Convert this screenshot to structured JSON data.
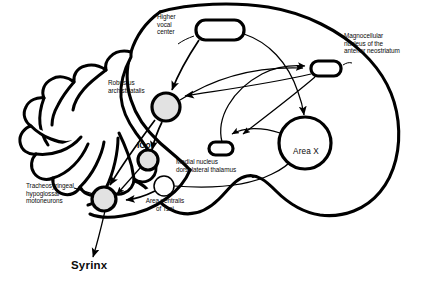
{
  "figure": {
    "kind": "anatomical-circuit-diagram",
    "background_color": "#ffffff",
    "stroke_color": "#000000",
    "nucleus_fill_shaded": "#e2e2e2",
    "nucleus_fill_plain": "#ffffff"
  },
  "labels": {
    "higher_vocal_center": "Higher\nvocal\ncenter",
    "magnocellular_nucleus": "Magnocellular\nnucleus of the\nanterior neostriatum",
    "robustus_archistriatalis": "Robustus\narchistriatalis",
    "medial_nucleus_dlm": "Medial nucleus\ndorsolateral thalamus",
    "area_x": "Area X",
    "ico": "ICo",
    "tracheosyringeal": "Tracheosyringeal\nhypoglossal\nmotoneurons",
    "area_ventralis_tsai": "Area ventralis\nof Tsai",
    "syrinx": "Syrinx"
  },
  "nodes": [
    {
      "id": "hvc",
      "label": "Higher vocal center",
      "shape": "rounded-rect",
      "fill": "#ffffff",
      "x": 196,
      "y": 20,
      "w": 48,
      "h": 20
    },
    {
      "id": "man",
      "label": "Magnocellular nucleus of the anterior neostriatum",
      "shape": "rounded-rect",
      "fill": "#ffffff",
      "x": 311,
      "y": 62,
      "w": 30,
      "h": 14
    },
    {
      "id": "ra",
      "label": "Robustus archistriatalis",
      "shape": "circle",
      "fill": "#e2e2e2",
      "cx": 166,
      "cy": 108,
      "r": 14
    },
    {
      "id": "dlm",
      "label": "Medial nucleus dorsolateral thalamus",
      "shape": "rounded-rect",
      "fill": "#ffffff",
      "x": 209,
      "y": 143,
      "w": 24,
      "h": 12
    },
    {
      "id": "areax",
      "label": "Area X",
      "shape": "circle",
      "fill": "#ffffff",
      "cx": 305,
      "cy": 143,
      "r": 26
    },
    {
      "id": "ico",
      "label": "ICo",
      "shape": "circle",
      "fill": "#e2e2e2",
      "cx": 148,
      "cy": 160,
      "r": 10
    },
    {
      "id": "nxiits",
      "label": "Tracheosyringeal hypoglossal motoneurons",
      "shape": "circle",
      "fill": "#e2e2e2",
      "cx": 104,
      "cy": 199,
      "r": 12
    },
    {
      "id": "avt",
      "label": "Area ventralis of Tsai",
      "shape": "circle",
      "fill": "#ffffff",
      "cx": 164,
      "cy": 186,
      "r": 10
    }
  ],
  "connections": [
    {
      "from": "hvc",
      "to": "ra",
      "arrow": true
    },
    {
      "from": "hvc",
      "to": "areax",
      "arrow": true
    },
    {
      "from": "ra",
      "to": "man",
      "arrow": true
    },
    {
      "from": "man",
      "to": "ra",
      "arrow": true
    },
    {
      "from": "man",
      "to": "dlm",
      "arrow": true
    },
    {
      "from": "dlm",
      "to": "man",
      "arrow": true
    },
    {
      "from": "areax",
      "to": "dlm",
      "arrow": true
    },
    {
      "from": "avt",
      "to": "areax",
      "arrow": true
    },
    {
      "from": "ra",
      "to": "ico",
      "arrow": true
    },
    {
      "from": "ra",
      "to": "nxiits",
      "arrow": true
    },
    {
      "from": "ico",
      "to": "nxiits",
      "arrow": true
    },
    {
      "from": "avt",
      "to": "nxiits",
      "arrow": true
    },
    {
      "from": "nxiits",
      "to": "syrinx",
      "arrow": true
    }
  ]
}
